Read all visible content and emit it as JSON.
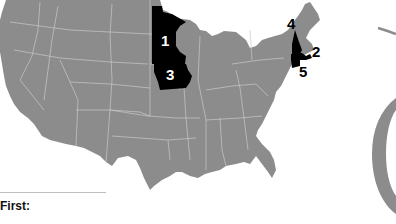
{
  "map": {
    "base_color": "#8c8c8c",
    "border_color": "#c8c8c8",
    "highlight_color": "#000000",
    "highlighted_states": [
      {
        "rank": "1",
        "state": "Minnesota",
        "label_color": "#ffffff"
      },
      {
        "rank": "2",
        "state": "Massachusetts",
        "label_color": "#000000"
      },
      {
        "rank": "3",
        "state": "Iowa",
        "label_color": "#ffffff"
      },
      {
        "rank": "4",
        "state": "New Hampshire",
        "label_color": "#000000"
      },
      {
        "rank": "5",
        "state": "Connecticut",
        "label_color": "#000000"
      }
    ]
  },
  "legend": {
    "heading": "First:"
  },
  "ring": {
    "color": "#8c8c8c"
  }
}
